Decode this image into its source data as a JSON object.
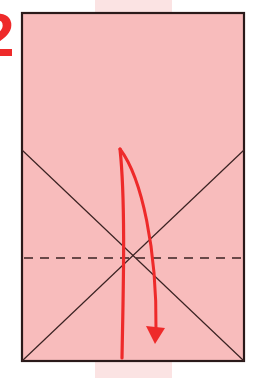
{
  "step": {
    "number": "2"
  },
  "diagram": {
    "paper": {
      "x": 22,
      "y": 13,
      "width": 222,
      "height": 348,
      "fill": "#f8bcbc",
      "stroke": "#2a1a1a"
    },
    "crease_lines": [
      {
        "x1": 22,
        "y1": 150,
        "x2": 244,
        "y2": 361
      },
      {
        "x1": 244,
        "y1": 150,
        "x2": 22,
        "y2": 361
      }
    ],
    "valley_fold_line": {
      "x1": 22,
      "y1": 258,
      "x2": 244,
      "y2": 258,
      "dash": "9 7"
    },
    "arrow": {
      "color": "#ee2a2a",
      "description": "curved fold arrow from top down to bottom",
      "path": "M122 358 C 124 300, 126 200, 120 149 C 140 175, 158 250, 156 335"
    },
    "colors": {
      "accent": "#ee2a2a",
      "paper": "#f8bcbc",
      "stripe": "#fbe3e3",
      "line": "#2a1a1a"
    }
  }
}
